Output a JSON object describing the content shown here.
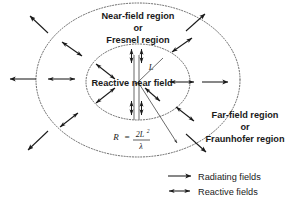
{
  "figure": {
    "near_field": {
      "line1": "Near-field region",
      "line2": "or",
      "line3": "Fresnel region"
    },
    "far_field": {
      "line1": "Far-field region",
      "line2": "or",
      "line3": "Fraunhofer region"
    },
    "reactive_near_field_label": "Reactive near field",
    "antenna_length_symbol": "L",
    "formula": {
      "lhs": "R",
      "equals": "=",
      "numerator": "2L",
      "numerator_exponent": "2",
      "denominator": "λ"
    },
    "legend": {
      "items": [
        {
          "icon": "single-headed-arrow",
          "label": "Radiating fields"
        },
        {
          "icon": "double-headed-arrow",
          "label": "Reactive fields"
        }
      ]
    },
    "colors": {
      "ring_stroke": "#555555",
      "arrow_stroke": "#1a1a1a",
      "antenna_stroke": "#8a8a8a",
      "text": "#1a1a1a",
      "background": "#ffffff"
    },
    "geometry": {
      "center_x": 138,
      "center_y": 82,
      "inner_rx": 52,
      "inner_ry": 38,
      "outer_rx": 102,
      "outer_ry": 76
    }
  }
}
